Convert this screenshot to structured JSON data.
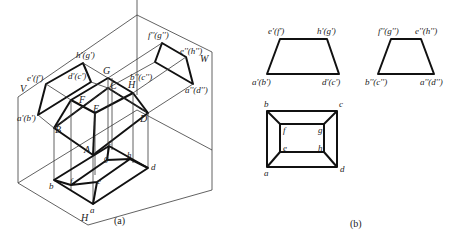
{
  "figure": {
    "panel_a": {
      "caption": "(a)",
      "plane_labels": {
        "V": "V",
        "W": "W",
        "H": "H"
      },
      "space_points": {
        "A": "A",
        "B": "B",
        "C": "C",
        "D": "D",
        "E": "E",
        "F": "F",
        "G": "G",
        "H": "H"
      },
      "v_projection": {
        "e_f": "e'(f')",
        "h_g": "h'(g')",
        "a_b": "a'(b')",
        "d_c": "d'(c')"
      },
      "w_projection": {
        "f_g": "f''(g'')",
        "e_h": "e''(h'')",
        "b_c": "b''(c'')",
        "a_d": "a''(d'')"
      },
      "h_projection": {
        "a": "a",
        "b": "b",
        "c": "c",
        "d": "d",
        "e": "e",
        "f": "f",
        "g": "g",
        "h": "h"
      }
    },
    "panel_b": {
      "caption": "(b)",
      "front_view": {
        "e_f": "e'(f')",
        "h_g": "h'(g')",
        "a_b": "a'(b')",
        "d_c": "d'(c')"
      },
      "side_view": {
        "f_g": "f''(g'')",
        "e_h": "e''(h'')",
        "b_c": "b''(c'')",
        "a_d": "a''(d'')"
      },
      "top_view": {
        "a": "a",
        "b": "b",
        "c": "c",
        "d": "d",
        "e": "e",
        "f": "f",
        "g": "g",
        "h": "h"
      }
    }
  },
  "colors": {
    "line": "#111111",
    "thin_line": "#3a3a3a",
    "background": "#ffffff"
  }
}
